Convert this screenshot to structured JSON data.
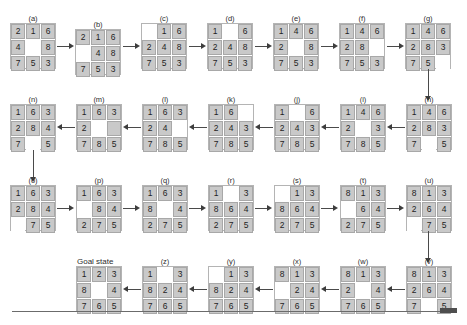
{
  "figure": {
    "title_text": "8-puzzle solution path",
    "goal_label": "Goal state",
    "tile_color": "#c9c9c9",
    "blank_color": "#ffffff",
    "arrow_color": "#4a4a4a"
  },
  "nodes": [
    {
      "id": "a",
      "label": "(a)",
      "row": 1,
      "tiles": [
        "2",
        "1",
        "6",
        "4",
        "",
        "8",
        "7",
        "5",
        "3"
      ]
    },
    {
      "id": "b",
      "label": "(b)",
      "row": 1,
      "tiles": [
        "2",
        "1",
        "6",
        "",
        "4",
        "8",
        "7",
        "5",
        "3"
      ]
    },
    {
      "id": "c",
      "label": "(c)",
      "row": 1,
      "tiles": [
        "",
        "1",
        "6",
        "2",
        "4",
        "8",
        "7",
        "5",
        "3"
      ]
    },
    {
      "id": "d",
      "label": "(d)",
      "row": 1,
      "tiles": [
        "1",
        "",
        "6",
        "2",
        "4",
        "8",
        "7",
        "5",
        "3"
      ]
    },
    {
      "id": "e",
      "label": "(e)",
      "row": 1,
      "tiles": [
        "1",
        "4",
        "6",
        "2",
        "",
        "8",
        "7",
        "5",
        "3"
      ]
    },
    {
      "id": "f",
      "label": "(f)",
      "row": 1,
      "tiles": [
        "1",
        "4",
        "6",
        "2",
        "8",
        "",
        "7",
        "5",
        "3"
      ]
    },
    {
      "id": "g",
      "label": "(g)",
      "row": 1,
      "tiles": [
        "1",
        "4",
        "6",
        "2",
        "8",
        "3",
        "7",
        "5",
        ""
      ]
    },
    {
      "id": "h",
      "label": "(h)",
      "row": 2,
      "tiles": [
        "1",
        "4",
        "6",
        "2",
        "8",
        "3",
        "7",
        "",
        "5"
      ]
    },
    {
      "id": "i",
      "label": "(i)",
      "row": 2,
      "tiles": [
        "1",
        "4",
        "6",
        "2",
        "",
        "3",
        "7",
        "8",
        "5"
      ]
    },
    {
      "id": "j",
      "label": "(j)",
      "row": 2,
      "tiles": [
        "1",
        "",
        "6",
        "2",
        "4",
        "3",
        "7",
        "8",
        "5"
      ]
    },
    {
      "id": "k",
      "label": "(k)",
      "row": 2,
      "tiles": [
        "1",
        "6",
        "",
        "2",
        "4",
        "3",
        "7",
        "8",
        "5"
      ]
    },
    {
      "id": "l",
      "label": "(l)",
      "row": 2,
      "tiles": [
        "1",
        "6",
        "3",
        "2",
        "4",
        "",
        "7",
        "8",
        "5"
      ]
    },
    {
      "id": "m",
      "label": "(m)",
      "row": 2,
      "tiles": [
        "1",
        "6",
        "3",
        "2",
        "",
        "4",
        "7",
        "8",
        "5"
      ]
    },
    {
      "id": "n",
      "label": "(n)",
      "row": 2,
      "tiles": [
        "1",
        "6",
        "3",
        "2",
        "8",
        "4",
        "7",
        "",
        "5"
      ]
    },
    {
      "id": "o",
      "label": "(o)",
      "row": 3,
      "tiles": [
        "1",
        "6",
        "3",
        "2",
        "8",
        "4",
        "",
        "7",
        "5"
      ]
    },
    {
      "id": "p",
      "label": "(p)",
      "row": 3,
      "tiles": [
        "1",
        "6",
        "3",
        "",
        "8",
        "4",
        "2",
        "7",
        "5"
      ]
    },
    {
      "id": "q",
      "label": "(q)",
      "row": 3,
      "tiles": [
        "1",
        "6",
        "3",
        "8",
        "",
        "4",
        "2",
        "7",
        "5"
      ]
    },
    {
      "id": "r",
      "label": "(r)",
      "row": 3,
      "tiles": [
        "1",
        "",
        "3",
        "8",
        "6",
        "4",
        "2",
        "7",
        "5"
      ]
    },
    {
      "id": "s",
      "label": "(s)",
      "row": 3,
      "tiles": [
        "",
        "1",
        "3",
        "8",
        "6",
        "4",
        "2",
        "7",
        "5"
      ]
    },
    {
      "id": "t",
      "label": "(t)",
      "row": 3,
      "tiles": [
        "8",
        "1",
        "3",
        "",
        "6",
        "4",
        "2",
        "7",
        "5"
      ]
    },
    {
      "id": "u",
      "label": "(u)",
      "row": 3,
      "tiles": [
        "8",
        "1",
        "3",
        "2",
        "6",
        "4",
        "",
        "7",
        "5"
      ]
    },
    {
      "id": "goal",
      "label": "Goal state",
      "row": 4,
      "tiles": [
        "1",
        "2",
        "3",
        "8",
        "",
        "4",
        "7",
        "6",
        "5"
      ]
    },
    {
      "id": "z",
      "label": "(z)",
      "row": 4,
      "tiles": [
        "1",
        "",
        "3",
        "8",
        "2",
        "4",
        "7",
        "6",
        "5"
      ]
    },
    {
      "id": "y",
      "label": "(y)",
      "row": 4,
      "tiles": [
        "",
        "1",
        "3",
        "8",
        "2",
        "4",
        "7",
        "6",
        "5"
      ]
    },
    {
      "id": "x",
      "label": "(x)",
      "row": 4,
      "tiles": [
        "8",
        "1",
        "3",
        "",
        "2",
        "4",
        "7",
        "6",
        "5"
      ]
    },
    {
      "id": "w",
      "label": "(w)",
      "row": 4,
      "tiles": [
        "8",
        "1",
        "3",
        "2",
        "",
        "4",
        "7",
        "6",
        "5"
      ]
    },
    {
      "id": "v",
      "label": "(v)",
      "row": 4,
      "tiles": [
        "8",
        "1",
        "3",
        "2",
        "6",
        "4",
        "7",
        "",
        "5"
      ]
    }
  ]
}
